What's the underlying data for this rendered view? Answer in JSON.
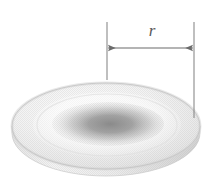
{
  "figure": {
    "type": "technical-illustration",
    "background_color": "#ffffff",
    "dimension": {
      "label": "r",
      "label_font_style": "italic-serif",
      "label_color": "#5a5a5a",
      "arrow_style": "double-headed",
      "arrow_color": "#6b6b6b",
      "arrow_y": 48,
      "arrow_x_start": 107,
      "arrow_x_end": 194,
      "label_x": 152,
      "label_y": 32,
      "extension_lines": [
        {
          "name": "left-extension-line",
          "x": 107,
          "y_top": 22,
          "y_bottom": 80
        },
        {
          "name": "right-extension-line",
          "x": 194,
          "y_top": 22,
          "y_bottom": 118
        }
      ]
    },
    "disk": {
      "center_x": 106,
      "center_y": 126,
      "top_rx": 94,
      "top_ry": 43,
      "thickness": 15,
      "rim_color_light": "#f2f2f2",
      "rim_color_mid": "#e2e2e2",
      "rim_color_shadow": "#cfcfcf",
      "side_color": "#e8e8e8",
      "outline_color": "#c8c8c8",
      "depression": {
        "center_x": 108,
        "center_y": 124,
        "rx": 56,
        "ry": 22,
        "color_center": "#8f8f8f",
        "color_edge": "#e9e9e9"
      },
      "texture": "halftone-dot-screen"
    }
  }
}
